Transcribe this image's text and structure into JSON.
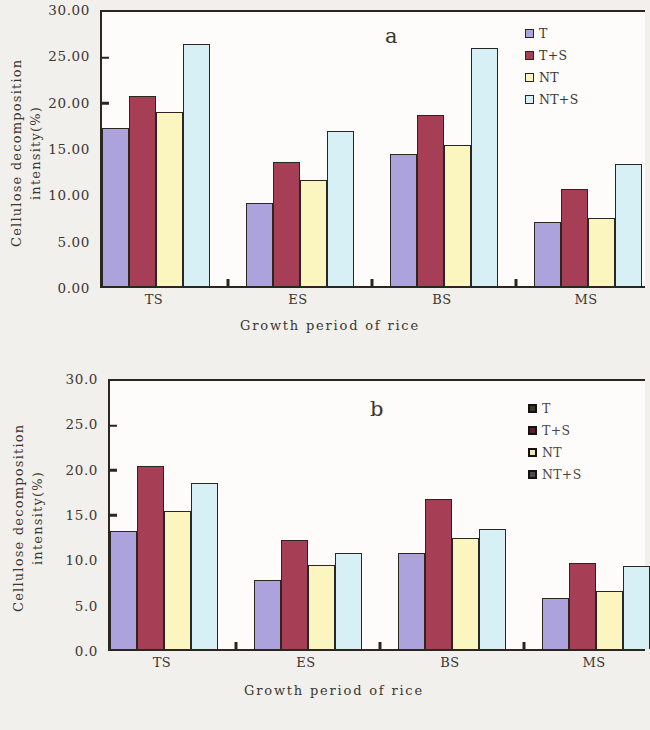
{
  "chart_data": [
    {
      "type": "bar",
      "panel": "a",
      "title": "",
      "xlabel": "Growth period of rice",
      "ylabel": "Cellulose decomposition intensity(%)",
      "ylabel_line1": "Cellulose decomposition",
      "ylabel_line2": "intensity(%)",
      "categories": [
        "TS",
        "ES",
        "BS",
        "MS"
      ],
      "ylim": [
        0,
        30
      ],
      "ytick_labels": [
        "30.00",
        "25.00",
        "20.00",
        "15.00",
        "10.00",
        "5.00",
        "0.00"
      ],
      "ytick_values": [
        30,
        25,
        20,
        15,
        10,
        5,
        0
      ],
      "grid": false,
      "legend_position": "top-right",
      "series": [
        {
          "name": "T",
          "color": "#aca3dd",
          "values": [
            17.3,
            9.1,
            14.4,
            7.0
          ]
        },
        {
          "name": "T+S",
          "color": "#a63e55",
          "values": [
            20.8,
            13.6,
            18.7,
            10.6
          ]
        },
        {
          "name": "NT",
          "color": "#fbf5c0",
          "values": [
            19.0,
            11.6,
            15.4,
            7.5
          ]
        },
        {
          "name": "NT+S",
          "color": "#d6f0f5",
          "values": [
            26.5,
            17.0,
            26.1,
            13.4
          ]
        }
      ]
    },
    {
      "type": "bar",
      "panel": "b",
      "title": "",
      "xlabel": "Growth period of rice",
      "ylabel": "Cellulose decomposition intensity(%)",
      "ylabel_line1": "Cellulose decomposition",
      "ylabel_line2": "intensity(%)",
      "categories": [
        "TS",
        "ES",
        "BS",
        "MS"
      ],
      "ylim": [
        0,
        30
      ],
      "ytick_labels": [
        "30.0",
        "25.0",
        "20.0",
        "15.0",
        "10.0",
        "5.0",
        "0.0"
      ],
      "ytick_values": [
        30,
        25,
        20,
        15,
        10,
        5,
        0
      ],
      "grid": false,
      "legend_position": "top-right",
      "series": [
        {
          "name": "T",
          "color": "#aca3dd",
          "values": [
            13.2,
            7.7,
            10.7,
            5.7
          ]
        },
        {
          "name": "T+S",
          "color": "#a63e55",
          "values": [
            20.5,
            12.2,
            16.8,
            9.6
          ]
        },
        {
          "name": "NT",
          "color": "#fbf5c0",
          "values": [
            15.4,
            9.4,
            12.4,
            6.5
          ]
        },
        {
          "name": "NT+S",
          "color": "#d6f0f5",
          "values": [
            18.6,
            10.8,
            13.4,
            9.3
          ]
        }
      ]
    }
  ],
  "figure_a": {
    "panel_letter": "a",
    "ylabel_line1": "Cellulose decomposition",
    "ylabel_line2": "intensity(%)",
    "xtitle": "Growth period of rice",
    "yticks": [
      "30.00",
      "25.00",
      "20.00",
      "15.00",
      "10.00",
      "5.00",
      "0.00"
    ],
    "categories": [
      "TS",
      "ES",
      "BS",
      "MS"
    ],
    "legend": [
      {
        "label": "T",
        "color": "#aca3dd"
      },
      {
        "label": "T+S",
        "color": "#a63e55"
      },
      {
        "label": "NT",
        "color": "#fbf5c0"
      },
      {
        "label": "NT+S",
        "color": "#d6f0f5"
      }
    ]
  },
  "figure_b": {
    "panel_letter": "b",
    "ylabel_line1": "Cellulose decomposition",
    "ylabel_line2": "intensity(%)",
    "xtitle": "Growth period of rice",
    "yticks": [
      "30.0",
      "25.0",
      "20.0",
      "15.0",
      "10.0",
      "5.0",
      "0.0"
    ],
    "categories": [
      "TS",
      "ES",
      "BS",
      "MS"
    ],
    "legend": [
      {
        "label": "T",
        "color": "#3a3630"
      },
      {
        "label": "T+S",
        "color": "#5e1f2c"
      },
      {
        "label": "NT",
        "color": "#efe7b6"
      },
      {
        "label": "NT+S",
        "color": "#4a4a52"
      }
    ]
  }
}
